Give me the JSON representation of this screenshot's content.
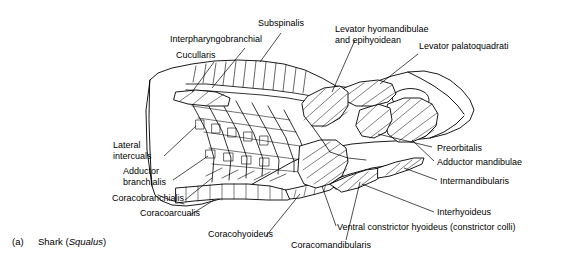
{
  "figure": {
    "panel_letter": "(a)",
    "caption_common_name": "Shark (",
    "caption_genus": "Squalus",
    "caption_close": ")",
    "background_color": "#ffffff",
    "line_color": "#000000",
    "muscle_fill": "#d8d8d8"
  },
  "labels": [
    {
      "id": "subspinalis",
      "text": "Subspinalis",
      "align": "left"
    },
    {
      "id": "levator-hyomandibulae",
      "text": "Levator hyomandibulae\nand epihyoidean",
      "align": "left"
    },
    {
      "id": "levator-palatoquadrati",
      "text": "Levator palatoquadrati",
      "align": "left"
    },
    {
      "id": "interpharyngobranchial",
      "text": "Interpharyngobranchial",
      "align": "left"
    },
    {
      "id": "cucullaris",
      "text": "Cucullaris",
      "align": "left"
    },
    {
      "id": "lateral-intercuals",
      "text": "Lateral\nintercuals",
      "align": "left"
    },
    {
      "id": "adductor-branchialis",
      "text": "Adductor\nbranchialis",
      "align": "left"
    },
    {
      "id": "coracobranchialis",
      "text": "Coracobranchialis",
      "align": "left"
    },
    {
      "id": "coracoarcualis",
      "text": "Coracoarcualis",
      "align": "left"
    },
    {
      "id": "coracohyoideus",
      "text": "Coracohyoideus",
      "align": "left"
    },
    {
      "id": "coracomandibularis",
      "text": "Coracomandibularis",
      "align": "left"
    },
    {
      "id": "ventral-constrictor-hyoideus",
      "text": "Ventral constrictor hyoideus (constrictor colli)",
      "align": "left"
    },
    {
      "id": "interhyoideus",
      "text": "Interhyoideus",
      "align": "left"
    },
    {
      "id": "intermandibularis",
      "text": "Intermandibularis",
      "align": "left"
    },
    {
      "id": "adductor-mandibulae",
      "text": "Adductor mandibulae",
      "align": "left"
    },
    {
      "id": "preorbitalis",
      "text": "Preorbitalis",
      "align": "left"
    }
  ]
}
